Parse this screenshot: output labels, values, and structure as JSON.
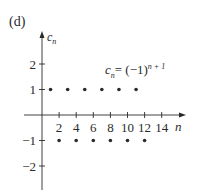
{
  "panel_label": "(d)",
  "formula": {
    "lhs": "c",
    "lhs_sub": "n",
    "eq": "= (−1)",
    "exp": "n + 1"
  },
  "colors": {
    "ink": "#2a2a2a",
    "background": "#ffffff"
  },
  "chart_data": {
    "type": "scatter",
    "title": "",
    "annotation": "c_n = (−1)^(n+1)",
    "xlabel": "n",
    "ylabel": "c_n",
    "xlim": [
      0,
      16
    ],
    "ylim": [
      -2.5,
      2.8
    ],
    "x_ticks": [
      2,
      4,
      6,
      8,
      10,
      12,
      14
    ],
    "x_tick_labels": [
      "2",
      "4",
      "6",
      "8",
      "10",
      "12",
      "14"
    ],
    "y_ticks": [
      -2,
      -1,
      1,
      2
    ],
    "y_tick_labels": [
      "−2",
      "−1",
      "1",
      "2"
    ],
    "grid": false,
    "legend": null,
    "series": [
      {
        "name": "c_n = (−1)^(n+1)",
        "x": [
          1,
          2,
          3,
          4,
          5,
          6,
          7,
          8,
          9,
          10,
          11,
          12
        ],
        "y": [
          1,
          -1,
          1,
          -1,
          1,
          -1,
          1,
          -1,
          1,
          -1,
          1,
          -1
        ]
      }
    ]
  }
}
